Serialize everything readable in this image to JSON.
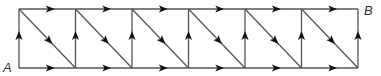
{
  "diagram": {
    "type": "directed-grid-graph",
    "labels": {
      "start": "A",
      "end": "B"
    },
    "columns": 6,
    "rows": 1,
    "node_x": [
      19,
      75.5,
      132,
      188.5,
      245,
      301.5,
      358
    ],
    "top_y": 9,
    "bottom_y": 68,
    "edges": {
      "horizontal_direction": "right",
      "vertical_direction": "up",
      "diagonal_direction": "down-right"
    },
    "colors": {
      "line": "#555555",
      "arrow": "#111111",
      "label": "#333333"
    }
  }
}
